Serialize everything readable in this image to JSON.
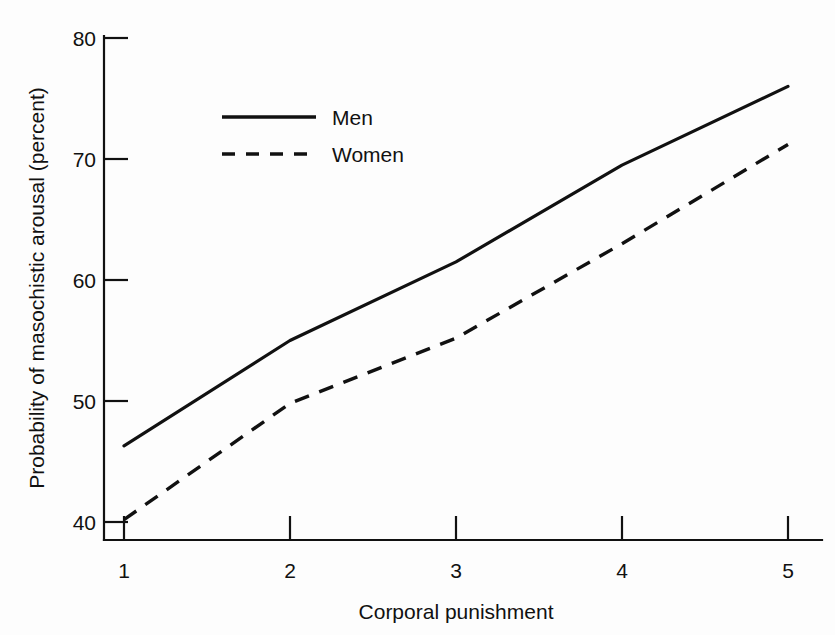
{
  "chart_data": {
    "type": "line",
    "title": "",
    "subtitle": "",
    "xlabel": "Corporal punishment",
    "ylabel": "Probability of masochistic arousal (percent)",
    "x": [
      1,
      2,
      3,
      4,
      5
    ],
    "xticklabels": [
      "1",
      "2",
      "3",
      "4",
      "5"
    ],
    "yticklabels": [
      "40",
      "50",
      "60",
      "70",
      "80"
    ],
    "yticks": [
      40,
      50,
      60,
      70,
      80
    ],
    "xlim": [
      1,
      5
    ],
    "ylim": [
      38,
      80
    ],
    "grid": false,
    "legend_position": "upper-left-inside",
    "series": [
      {
        "name": "Men",
        "style": "solid",
        "color": "#111111",
        "values": [
          46.3,
          55.0,
          61.5,
          69.5,
          76.0
        ]
      },
      {
        "name": "Women",
        "style": "dashed",
        "color": "#111111",
        "values": [
          40.2,
          49.8,
          55.2,
          63.0,
          71.2
        ]
      }
    ]
  },
  "legend": {
    "entries": [
      {
        "label": "Men",
        "style": "solid"
      },
      {
        "label": "Women",
        "style": "dashed"
      }
    ]
  },
  "axes": {
    "x_title": "Corporal punishment",
    "y_title": "Probability of masochistic arousal (percent)",
    "x_ticks": [
      "1",
      "2",
      "3",
      "4",
      "5"
    ],
    "y_ticks": [
      "40",
      "50",
      "60",
      "70",
      "80"
    ]
  }
}
